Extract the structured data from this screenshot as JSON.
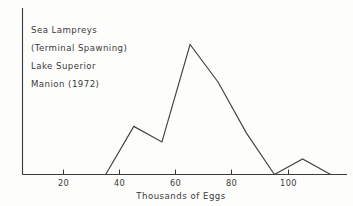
{
  "chart_data": {
    "type": "line",
    "title": "",
    "xlabel": "Thousands of Eggs",
    "ylabel": "",
    "xlim": [
      5,
      120
    ],
    "ylim": [
      0,
      140
    ],
    "grid": false,
    "legend": null,
    "xticks": [
      20,
      40,
      60,
      80,
      100
    ],
    "xtick_labels": [
      "20",
      "40",
      "60",
      "80",
      "100"
    ],
    "series": [
      {
        "name": "Sea Lampreys (Terminal Spawning), Lake Superior",
        "x": [
          35,
          45,
          55,
          65,
          75,
          85,
          95,
          105,
          115
        ],
        "values": [
          0,
          37,
          25,
          100,
          71,
          32,
          0,
          12,
          0
        ]
      }
    ]
  },
  "annotation": {
    "lines": [
      "Sea  Lampreys",
      "(Terminal  Spawning)",
      "Lake  Superior",
      "Manion  (1972)"
    ]
  },
  "axis": {
    "title": "Thousands of Eggs",
    "tick_20": "20",
    "tick_40": "40",
    "tick_60": "60",
    "tick_80": "80",
    "tick_100": "100"
  },
  "colors": {
    "ink": "#3b3b3b",
    "line": "#43423f",
    "background": "#fdfdfc"
  }
}
